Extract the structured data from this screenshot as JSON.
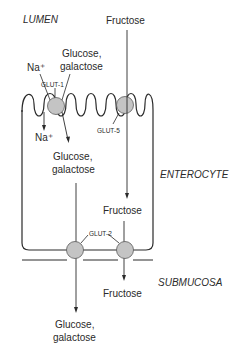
{
  "regions": {
    "lumen": "LUMEN",
    "enterocyte": "ENTEROCYTE",
    "submucosa": "SUBMUCOSA"
  },
  "substrates": {
    "fructose_lumen": "Fructose",
    "na_lumen": "Na⁺",
    "glucose_lumen_line1": "Glucose,",
    "glucose_lumen_line2": "galactose",
    "na_cell": "Na⁺",
    "glucose_cell_line1": "Glucose,",
    "glucose_cell_line2": "galactose",
    "fructose_cell": "Fructose",
    "fructose_submucosa": "Fructose",
    "glucose_submucosa_line1": "Glucose,",
    "glucose_submucosa_line2": "galactose"
  },
  "transporters": {
    "glut1": "GLUT-1",
    "glut5": "GLUT-5",
    "glut2": "GLUT-2"
  },
  "colors": {
    "line": "#2a2a2a",
    "transporter_fill": "#c4c4c4",
    "transporter_stroke": "#5a5a5a"
  }
}
